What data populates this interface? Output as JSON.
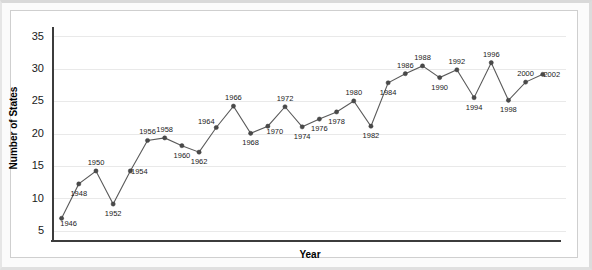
{
  "chart_data": {
    "type": "line",
    "title": "",
    "xlabel": "Year",
    "ylabel": "Number of States",
    "xlim": [
      1945,
      2004
    ],
    "ylim": [
      3.5,
      36.5
    ],
    "yticks": [
      5,
      10,
      15,
      20,
      25,
      30,
      35
    ],
    "grid": true,
    "legend": false,
    "legend_position": "none",
    "point_labels_shown": true,
    "x": [
      1946,
      1948,
      1950,
      1952,
      1954,
      1956,
      1958,
      1960,
      1962,
      1964,
      1966,
      1968,
      1970,
      1972,
      1974,
      1976,
      1978,
      1980,
      1982,
      1984,
      1986,
      1988,
      1990,
      1992,
      1994,
      1996,
      1998,
      2000,
      2002
    ],
    "values": [
      7.0,
      12.3,
      14.3,
      9.2,
      14.3,
      19.0,
      19.4,
      18.2,
      17.2,
      21.0,
      24.3,
      20.1,
      21.2,
      24.2,
      21.1,
      22.3,
      23.4,
      25.1,
      21.2,
      27.9,
      29.3,
      30.5,
      28.7,
      29.9,
      25.6,
      31.0,
      25.2,
      28.0,
      29.2
    ],
    "point_label_text": [
      "1946",
      "1948",
      "1950",
      "1952",
      "1954",
      "1956",
      "1958",
      "1960",
      "1962",
      "1964",
      "1966",
      "1968",
      "1970",
      "1972",
      "1974",
      "1976",
      "1978",
      "1980",
      "1982",
      "1984",
      "1986",
      "1988",
      "1990",
      "1992",
      "1994",
      "1996",
      "1998",
      "2000",
      "2002"
    ],
    "point_label_side": [
      "right-below",
      "below",
      "above",
      "below",
      "right",
      "above",
      "above",
      "below",
      "below",
      "above-left",
      "above",
      "below",
      "right-below",
      "above",
      "below",
      "below",
      "below",
      "above",
      "below",
      "below",
      "above",
      "above",
      "below",
      "above",
      "below",
      "above",
      "below",
      "above",
      "right"
    ],
    "colors": {
      "line": "#5a5a5a",
      "marker": "#4a4a4a",
      "grid": "#e9e9e9",
      "axis": "#3c3c3c",
      "text": "#1a1a1a",
      "background": "#ffffff",
      "frame": "#cfcfcf"
    }
  },
  "axes": {
    "y_tick_labels": [
      "35",
      "30",
      "25",
      "20",
      "15",
      "10",
      "5"
    ],
    "y_title": "Number of States",
    "x_title": "Year"
  }
}
